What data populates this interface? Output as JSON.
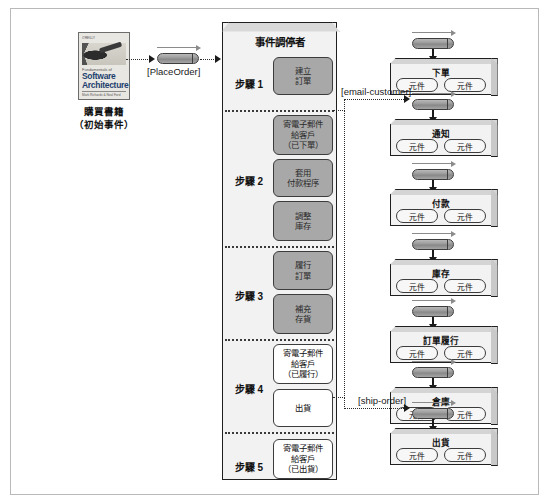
{
  "diagram": {
    "initiating_event": {
      "caption_line1": "購買書籍",
      "caption_line2": "（初始事件）",
      "book": {
        "imprint": "O'REILLY",
        "subtitle": "Fundamentals of",
        "title_line1": "Software",
        "title_line2": "Architecture",
        "tagline": "An Engineering Approach",
        "authors": "Mark Richards & Neal Ford"
      }
    },
    "channels": [
      {
        "id": "place-order",
        "label": "[PlaceOrder]"
      },
      {
        "id": "email-customer",
        "label": "[email-customer]"
      },
      {
        "id": "ship-order",
        "label": "[ship-order]"
      }
    ],
    "mediator": {
      "title": "事件調停者",
      "steps": [
        {
          "label": "步驟 1",
          "tasks": [
            {
              "text": "建立\n訂單",
              "style": "grey"
            }
          ]
        },
        {
          "label": "步驟 2",
          "tasks": [
            {
              "text": "寄電子郵件\n給客戶\n（已下單）",
              "style": "grey"
            },
            {
              "text": "套用\n付款程序",
              "style": "grey"
            },
            {
              "text": "調整\n庫存",
              "style": "grey"
            }
          ]
        },
        {
          "label": "步驟 3",
          "tasks": [
            {
              "text": "履行\n訂單",
              "style": "grey"
            },
            {
              "text": "補充\n存貨",
              "style": "grey"
            }
          ]
        },
        {
          "label": "步驟 4",
          "tasks": [
            {
              "text": "寄電子郵件\n給客戶\n（已履行）",
              "style": "white"
            },
            {
              "text": "出貨",
              "style": "white"
            }
          ]
        },
        {
          "label": "步驟 5",
          "tasks": [
            {
              "text": "寄電子郵件\n給客戶\n（已出貨）",
              "style": "white"
            }
          ]
        }
      ]
    },
    "services": [
      {
        "title": "下單",
        "components": [
          "元件",
          "元件"
        ]
      },
      {
        "title": "通知",
        "components": [
          "元件",
          "元件"
        ]
      },
      {
        "title": "付款",
        "components": [
          "元件",
          "元件"
        ]
      },
      {
        "title": "庫存",
        "components": [
          "元件",
          "元件"
        ]
      },
      {
        "title": "訂單履行",
        "components": [
          "元件",
          "元件"
        ]
      },
      {
        "title": "倉庫",
        "components": [
          "元件",
          "元件"
        ]
      },
      {
        "title": "出貨",
        "components": [
          "元件",
          "元件"
        ]
      }
    ],
    "colors": {
      "frame_border": "#b9b9b9",
      "mediator_fill": "#f2f2f2",
      "mediator_border": "#1f1f1f",
      "task_grey": "#a8a8a8",
      "task_white": "#ffffff",
      "service_fill": "#f2f2f2",
      "connector": "#2b2b2b",
      "queue_pill": "#9a9a9a"
    }
  }
}
